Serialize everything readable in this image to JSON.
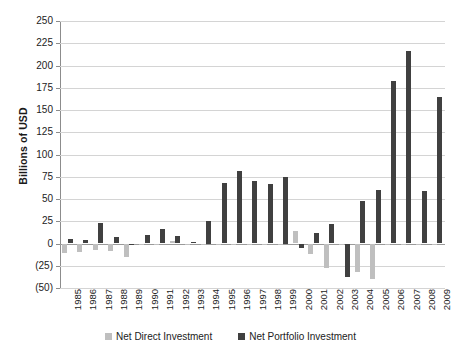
{
  "chart_data": {
    "type": "bar",
    "title": "",
    "xlabel": "",
    "ylabel": "Billions of USD",
    "ylim": [
      -50,
      250
    ],
    "ytick_step": 25,
    "ytick_labels": [
      "250",
      "225",
      "200",
      "175",
      "150",
      "125",
      "100",
      "75",
      "50",
      "25",
      "0",
      "(25)",
      "(50)"
    ],
    "ytick_values": [
      250,
      225,
      200,
      175,
      150,
      125,
      100,
      75,
      50,
      25,
      0,
      -25,
      -50
    ],
    "grid": true,
    "legend_position": "bottom",
    "categories": [
      "1985",
      "1986",
      "1987",
      "1988",
      "1989",
      "1990",
      "1991",
      "1992",
      "1993",
      "1994",
      "1995",
      "1996",
      "1997",
      "1998",
      "1999",
      "2000",
      "2001",
      "2002",
      "2003",
      "2004",
      "2005",
      "2006",
      "2007",
      "2008",
      "2009"
    ],
    "series": [
      {
        "name": "Net Direct Investment",
        "color": "#bfbfbf",
        "values": [
          -11,
          -9,
          -7,
          -8,
          -15,
          -1,
          -1,
          3,
          -1,
          -1,
          -1,
          -1,
          -1,
          -1,
          -1,
          14,
          -12,
          -27,
          -1,
          -32,
          -40,
          -1,
          -1,
          -1,
          -1
        ]
      },
      {
        "name": "Net Portfolio Investment",
        "color": "#404040",
        "values": [
          5,
          4,
          23,
          7,
          -1,
          10,
          16,
          8,
          2,
          25,
          68,
          81,
          70,
          67,
          75,
          -5,
          12,
          22,
          -38,
          48,
          60,
          183,
          216,
          59,
          165
        ]
      }
    ]
  },
  "legend": {
    "items": [
      {
        "label": "Net Direct Investment",
        "swatch": "direct"
      },
      {
        "label": "Net Portfolio Investment",
        "swatch": "portfolio"
      }
    ]
  },
  "axis": {
    "y_title": "Billions of USD"
  }
}
